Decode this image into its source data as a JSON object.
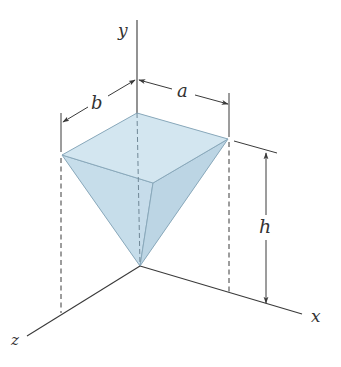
{
  "figure": {
    "type": "3d-geometry",
    "colors": {
      "top_face": "#d3e6f0",
      "left_face": "#c6dcea",
      "right_face": "#bcd5e4",
      "edge": "#8aa9bb",
      "axis": "#3a3a3a",
      "dim_line": "#3a3a3a"
    }
  },
  "axes": {
    "x_label": "x",
    "y_label": "y",
    "z_label": "z"
  },
  "dimensions": {
    "a_label": "a",
    "b_label": "b",
    "h_label": "h"
  }
}
